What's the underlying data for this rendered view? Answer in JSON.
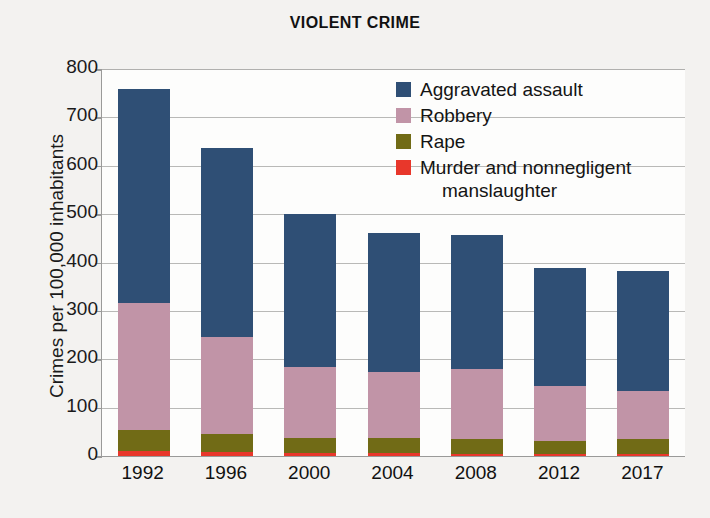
{
  "chart_data": {
    "type": "bar",
    "subtype": "stacked-bar",
    "title": "VIOLENT CRIME",
    "xlabel": "",
    "ylabel": "Crimes per 100,000 inhabitants",
    "ylim": [
      0,
      800
    ],
    "yticks": [
      800,
      700,
      600,
      500,
      400,
      300,
      200,
      100,
      0
    ],
    "grid": true,
    "legend_position": "top-right-inside",
    "categories": [
      "1992",
      "1996",
      "2000",
      "2004",
      "2008",
      "2012",
      "2017"
    ],
    "series": [
      {
        "name": "Aggravated assault",
        "color": "#2f4f75",
        "values": [
          441,
          391,
          318,
          288,
          277,
          243,
          249
        ]
      },
      {
        "name": "Robbery",
        "color": "#c194a7",
        "values": [
          264,
          201,
          145,
          136,
          145,
          113,
          98
        ]
      },
      {
        "name": "Rape",
        "color": "#716b16",
        "values": [
          43,
          37,
          32,
          32,
          30,
          27,
          31
        ]
      },
      {
        "name": "Murder and nonnegligent manslaughter",
        "color": "#e8372b",
        "values": [
          10,
          8,
          6,
          6,
          5,
          5,
          5
        ]
      }
    ],
    "totals": [
      758,
      637,
      501,
      462,
      457,
      388,
      383
    ]
  },
  "legend": {
    "items": [
      {
        "label": "Aggravated assault",
        "label_line2": "",
        "color": "#2f4f75"
      },
      {
        "label": "Robbery",
        "label_line2": "",
        "color": "#c194a7"
      },
      {
        "label": "Rape",
        "label_line2": "",
        "color": "#716b16"
      },
      {
        "label": "Murder and nonnegligent",
        "label_line2": "manslaughter",
        "color": "#e8372b"
      }
    ]
  },
  "colors": {
    "background": "#f3f2f0",
    "plot_background": "#fdfdfc",
    "axis": "#9a9a99",
    "gridline": "#b9b9b7",
    "text": "#1a1a1a"
  }
}
